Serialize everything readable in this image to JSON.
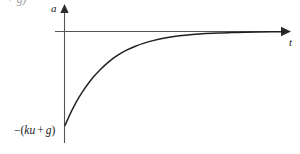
{
  "figure": {
    "name": "acceleration-vs-time-graph",
    "background_color": "#ffffff",
    "axis_color": "#555555",
    "curve_color": "#1f1f1f",
    "text_color": "#1a1a1a"
  },
  "labels": {
    "y_axis": "a",
    "x_axis": "t",
    "y_intercept_minus": "−",
    "y_intercept_open": "(",
    "y_intercept_ku": "ku",
    "y_intercept_plus": "+",
    "y_intercept_g": "g",
    "y_intercept_close": ")",
    "y_intercept_full": "−(ku + g)",
    "clipped_top_fragment": "+ g)"
  },
  "chart_data": {
    "type": "line",
    "title": "",
    "xlabel": "t",
    "ylabel": "a",
    "grid": false,
    "legend": null,
    "annotations": [
      {
        "text": "−(ku + g)",
        "at_x": 0,
        "at_y": -1,
        "description": "value of a at t = 0, the initial acceleration"
      }
    ],
    "axis_arrows": {
      "x": "right",
      "y": "up"
    },
    "xlim": [
      0,
      10
    ],
    "ylim": [
      -1.08,
      0.18
    ],
    "asymptote": 0,
    "series": [
      {
        "name": "a(t)",
        "formula": "a(t) = -(ku + g) * exp(-k t)",
        "x": [
          0,
          0.2,
          0.4,
          0.6,
          0.8,
          1.0,
          1.3,
          1.6,
          2.0,
          2.4,
          2.8,
          3.2,
          3.6,
          4.0,
          4.6,
          5.2,
          5.8,
          6.4,
          7.0,
          7.6,
          8.2,
          8.8,
          9.4,
          10.0
        ],
        "y": [
          -1.0,
          -0.895,
          -0.8,
          -0.715,
          -0.64,
          -0.572,
          -0.482,
          -0.406,
          -0.32,
          -0.252,
          -0.199,
          -0.157,
          -0.124,
          -0.097,
          -0.067,
          -0.046,
          -0.032,
          -0.022,
          -0.015,
          -0.011,
          -0.0072,
          -0.005,
          -0.0035,
          -0.0024
        ]
      }
    ]
  }
}
